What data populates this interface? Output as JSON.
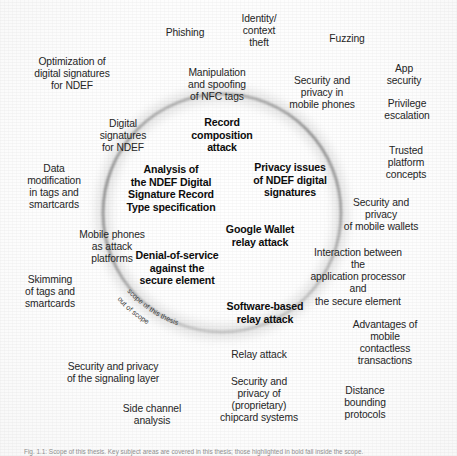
{
  "figure": {
    "title": "Scope of this thesis",
    "circle": {
      "center_x": 222,
      "center_y": 213,
      "radius": 119,
      "stroke_color": "#9a9a9a"
    },
    "scope_labels": {
      "inside": "scope of this thesis",
      "outside": "out of scope"
    },
    "inner_topics": [
      {
        "id": "record-composition-attack",
        "text": "Record\ncomposition\nattack",
        "x": 222,
        "y": 135
      },
      {
        "id": "analysis-ndef-digital-signature-record-type-specification",
        "text": "Analysis of\nthe NDEF Digital\nSignature Record\nType specification",
        "x": 171,
        "y": 188
      },
      {
        "id": "privacy-issues-ndef-digital-signatures",
        "text": "Privacy issues\nof NDEF digital\nsignatures",
        "x": 290,
        "y": 180
      },
      {
        "id": "google-wallet-relay-attack",
        "text": "Google Wallet\nrelay attack",
        "x": 260,
        "y": 235
      },
      {
        "id": "denial-of-service-against-secure-element",
        "text": "Denial-of-service\nagainst the\nsecure element",
        "x": 177,
        "y": 268
      },
      {
        "id": "software-based-relay-attack",
        "text": "Software-based\nrelay attack",
        "x": 265,
        "y": 312
      }
    ],
    "outer_topics": [
      {
        "id": "phishing",
        "text": "Phishing",
        "x": 185,
        "y": 33
      },
      {
        "id": "identity-context-theft",
        "text": "Identity/\ncontext\ntheft",
        "x": 259,
        "y": 31
      },
      {
        "id": "fuzzing",
        "text": "Fuzzing",
        "x": 347,
        "y": 39
      },
      {
        "id": "optimization-digital-signatures-ndef",
        "text": "Optimization of\ndigital signatures\nfor NDEF",
        "x": 72,
        "y": 74
      },
      {
        "id": "manipulation-spoofing-nfc-tags",
        "text": "Manipulation\nand spoofing\nof NFC tags",
        "x": 217,
        "y": 85
      },
      {
        "id": "security-privacy-mobile-phones",
        "text": "Security and\nprivacy in\nmobile phones",
        "x": 322,
        "y": 93
      },
      {
        "id": "app-security",
        "text": "App security",
        "x": 404,
        "y": 75
      },
      {
        "id": "privilege-escalation",
        "text": "Privilege\nescalation",
        "x": 407,
        "y": 110
      },
      {
        "id": "digital-signatures-ndef",
        "text": "Digital\nsignatures\nfor NDEF",
        "x": 123,
        "y": 136
      },
      {
        "id": "trusted-platform-concepts",
        "text": "Trusted\nplatform\nconcepts",
        "x": 406,
        "y": 163
      },
      {
        "id": "data-modification-tags-smartcards",
        "text": "Data\nmodification\nin tags and\nsmartcards",
        "x": 54,
        "y": 187
      },
      {
        "id": "security-privacy-mobile-wallets",
        "text": "Security and privacy\nof mobile wallets",
        "x": 381,
        "y": 215
      },
      {
        "id": "mobile-phones-attack-platforms",
        "text": "Mobile phones\nas attack\nplatforms",
        "x": 112,
        "y": 247
      },
      {
        "id": "interaction-application-processor-secure-element",
        "text": "Interaction between the\napplication processor and\nthe secure element",
        "x": 358,
        "y": 277
      },
      {
        "id": "skimming-tags-smartcards",
        "text": "Skimming\nof tags and\nsmartcards",
        "x": 50,
        "y": 292
      },
      {
        "id": "advantages-mobile-contactless-transactions",
        "text": "Advantages of\nmobile contactless\ntransactions",
        "x": 385,
        "y": 343
      },
      {
        "id": "relay-attack",
        "text": "Relay attack",
        "x": 259,
        "y": 355
      },
      {
        "id": "security-privacy-signaling-layer",
        "text": "Security and privacy\nof the signaling layer",
        "x": 113,
        "y": 373
      },
      {
        "id": "security-privacy-proprietary-chipcard-systems",
        "text": "Security and\nprivacy of\n(proprietary)\nchipcard systems",
        "x": 259,
        "y": 400
      },
      {
        "id": "side-channel-analysis",
        "text": "Side channel\nanalysis",
        "x": 152,
        "y": 415
      },
      {
        "id": "distance-bounding-protocols",
        "text": "Distance\nbounding\nprotocols",
        "x": 365,
        "y": 403
      }
    ],
    "caption": "Fig. 1.1: Scope of this thesis. Key subject areas are covered in this thesis; those highlighted in bold fall inside the scope."
  }
}
